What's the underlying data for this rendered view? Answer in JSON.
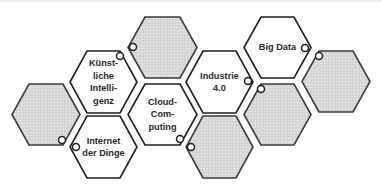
{
  "diagram": {
    "type": "hexagon-cluster",
    "colors": {
      "white_hex_fill": "#ffffff",
      "gray_hex_fill": "#dcdcdc",
      "stroke": "#1e1e1e",
      "text": "#2a2a2a"
    },
    "hexagons": [
      {
        "id": "left-gray",
        "filled": true,
        "label": ""
      },
      {
        "id": "kuenstliche-intelligenz",
        "filled": false,
        "label": "Künst-\nliche\nIntelli-\ngenz",
        "lines": [
          "Künst-",
          "liche",
          "Intelli-",
          "genz"
        ]
      },
      {
        "id": "internet-der-dinge",
        "filled": false,
        "label": "Internet der Dinge",
        "lines": [
          "Internet",
          "der Dinge"
        ]
      },
      {
        "id": "top-gray",
        "filled": true,
        "label": ""
      },
      {
        "id": "cloud-computing",
        "filled": false,
        "label": "Cloud-Com-puting",
        "lines": [
          "Cloud-",
          "Com-",
          "puting"
        ]
      },
      {
        "id": "bottom-gray",
        "filled": true,
        "label": ""
      },
      {
        "id": "industrie-4-0",
        "filled": false,
        "label": "Industrie 4.0",
        "lines": [
          "Industrie",
          "4.0"
        ]
      },
      {
        "id": "big-data",
        "filled": false,
        "label": "Big Data",
        "lines": [
          "Big Data"
        ]
      },
      {
        "id": "mid-gray",
        "filled": true,
        "label": ""
      },
      {
        "id": "right-gray",
        "filled": true,
        "label": ""
      }
    ]
  }
}
